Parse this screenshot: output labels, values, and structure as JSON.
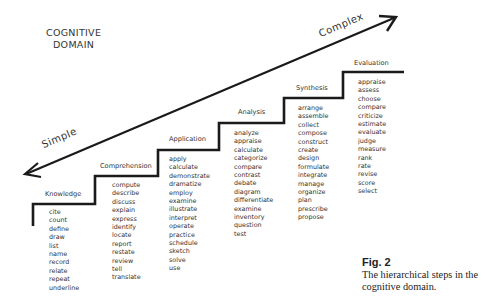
{
  "title": {
    "line1": "COGNITIVE",
    "line2": "DOMAIN"
  },
  "axis": {
    "low_label": "Simple",
    "high_label": "Complex"
  },
  "levels": [
    {
      "name": "Knowledge",
      "verbs": [
        "cite",
        "count",
        "define",
        "draw",
        "list",
        "name",
        "record",
        "relate",
        "repeat",
        "underline"
      ]
    },
    {
      "name": "Comprehension",
      "verbs": [
        "compute",
        "describe",
        "discuss",
        "explain",
        "express",
        "identify",
        "locate",
        "report",
        "restate",
        "review",
        "tell",
        "translate"
      ]
    },
    {
      "name": "Application",
      "verbs": [
        "apply",
        "calculate",
        "demonstrate",
        "dramatize",
        "employ",
        "examine",
        "illustrate",
        "interpret",
        "operate",
        "practice",
        "schedule",
        "sketch",
        "solve",
        "use"
      ]
    },
    {
      "name": "Analysis",
      "verbs": [
        "analyze",
        "appraise",
        "calculate",
        "categorize",
        "compare",
        "contrast",
        "debate",
        "diagram",
        "differentiate",
        "examine",
        "inventory",
        "question",
        "test"
      ]
    },
    {
      "name": "Synthesis",
      "verbs": [
        "arrange",
        "assemble",
        "collect",
        "compose",
        "construct",
        "create",
        "design",
        "formulate",
        "integrate",
        "manage",
        "organize",
        "plan",
        "prescribe",
        "propose"
      ]
    },
    {
      "name": "Evaluation",
      "verbs": [
        "appraise",
        "assess",
        "choose",
        "compare",
        "criticize",
        "estimate",
        "evaluate",
        "judge",
        "measure",
        "rank",
        "rate",
        "revise",
        "score",
        "select"
      ]
    }
  ],
  "caption": {
    "figure": "Fig. 2",
    "text": "The hierarchical steps in the cognitive domain."
  },
  "colors": {
    "ink": "#1a1a1a",
    "background": "#ffffff"
  }
}
